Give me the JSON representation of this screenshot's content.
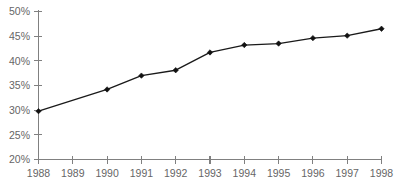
{
  "chart_data": {
    "type": "line",
    "title": "",
    "subtitle": "",
    "xlabel": "",
    "ylabel": "",
    "x": [
      1988,
      1989,
      1990,
      1991,
      1992,
      1993,
      1994,
      1995,
      1996,
      1997,
      1998
    ],
    "categories": [
      "1988",
      "1989",
      "1990",
      "1991",
      "1992",
      "1993",
      "1994",
      "1995",
      "1996",
      "1997",
      "1998"
    ],
    "values": [
      29.8,
      null,
      34.2,
      37.0,
      38.1,
      41.7,
      43.2,
      43.5,
      44.6,
      45.1,
      46.5
    ],
    "series": [
      {
        "name": "",
        "values": [
          29.8,
          null,
          34.2,
          37.0,
          38.1,
          41.7,
          43.2,
          43.5,
          44.6,
          45.1,
          46.5
        ],
        "marker": "diamond",
        "marked_points": [
          1988,
          1990,
          1991,
          1992,
          1993,
          1994,
          1995,
          1996,
          1997,
          1998
        ],
        "color": "#1a1a1a"
      }
    ],
    "ylim": [
      20,
      50
    ],
    "yticks": [
      20,
      25,
      30,
      35,
      40,
      45,
      50
    ],
    "ytick_labels": [
      "20%",
      "25%",
      "30%",
      "35%",
      "40%",
      "45%",
      "50%"
    ],
    "xticks": [
      1988,
      1989,
      1990,
      1991,
      1992,
      1993,
      1994,
      1995,
      1996,
      1997,
      1998
    ],
    "xtick_labels": [
      "1988",
      "1989",
      "1990",
      "1991",
      "1992",
      "1993",
      "1994",
      "1995",
      "1996",
      "1997",
      "1998"
    ],
    "xlim": [
      1988,
      1998
    ],
    "grid": false,
    "legend": null,
    "legend_position": "none",
    "annotations": [],
    "axis_color": "#808080",
    "label_color": "#666666",
    "background": "#ffffff"
  }
}
